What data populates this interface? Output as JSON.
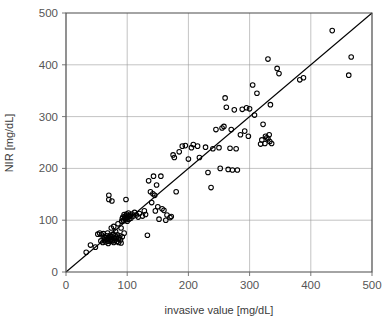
{
  "chart_data": {
    "type": "scatter",
    "title": "",
    "xlabel": "invasive value [mg/dL]",
    "ylabel": "NIR [mg/dL]",
    "xlim": [
      0,
      500
    ],
    "ylim": [
      0,
      500
    ],
    "xticks": [
      0,
      100,
      200,
      300,
      400,
      500
    ],
    "yticks": [
      0,
      100,
      200,
      300,
      400,
      500
    ],
    "xtick_labels": [
      "0",
      "100",
      "200",
      "300",
      "400",
      "500"
    ],
    "ytick_labels": [
      "0",
      "100",
      "200",
      "300",
      "400",
      "500"
    ],
    "grid": true,
    "legend": "none",
    "marker": "open-circle",
    "marker_color": "#000000",
    "annotations": [
      {
        "type": "line",
        "name": "identity-line",
        "description": "y = x reference line",
        "from": [
          0,
          0
        ],
        "to": [
          500,
          500
        ]
      }
    ],
    "series": [
      {
        "name": "NIR vs invasive",
        "points": [
          [
            33,
            38
          ],
          [
            40,
            52
          ],
          [
            48,
            48
          ],
          [
            52,
            73
          ],
          [
            55,
            75
          ],
          [
            57,
            60
          ],
          [
            58,
            72
          ],
          [
            60,
            57
          ],
          [
            61,
            74
          ],
          [
            62,
            68
          ],
          [
            63,
            62
          ],
          [
            64,
            66
          ],
          [
            65,
            58
          ],
          [
            66,
            70
          ],
          [
            67,
            64
          ],
          [
            68,
            75
          ],
          [
            68,
            60
          ],
          [
            69,
            55
          ],
          [
            70,
            148
          ],
          [
            70,
            140
          ],
          [
            71,
            66
          ],
          [
            72,
            71
          ],
          [
            72,
            59
          ],
          [
            73,
            64
          ],
          [
            74,
            85
          ],
          [
            74,
            62
          ],
          [
            75,
            137
          ],
          [
            75,
            68
          ],
          [
            76,
            60
          ],
          [
            77,
            73
          ],
          [
            78,
            88
          ],
          [
            78,
            57
          ],
          [
            79,
            65
          ],
          [
            80,
            70
          ],
          [
            80,
            61
          ],
          [
            81,
            78
          ],
          [
            82,
            67
          ],
          [
            83,
            59
          ],
          [
            84,
            72
          ],
          [
            85,
            93
          ],
          [
            85,
            64
          ],
          [
            86,
            57
          ],
          [
            87,
            66
          ],
          [
            88,
            70
          ],
          [
            89,
            62
          ],
          [
            90,
            85
          ],
          [
            90,
            56
          ],
          [
            91,
            98
          ],
          [
            92,
            103
          ],
          [
            92,
            68
          ],
          [
            93,
            106
          ],
          [
            94,
            99
          ],
          [
            95,
            111
          ],
          [
            95,
            75
          ],
          [
            96,
            104
          ],
          [
            97,
            108
          ],
          [
            98,
            101
          ],
          [
            98,
            140
          ],
          [
            99,
            112
          ],
          [
            100,
            105
          ],
          [
            100,
            98
          ],
          [
            101,
            109
          ],
          [
            102,
            114
          ],
          [
            103,
            102
          ],
          [
            104,
            107
          ],
          [
            105,
            110
          ],
          [
            106,
            104
          ],
          [
            108,
            112
          ],
          [
            110,
            108
          ],
          [
            112,
            115
          ],
          [
            115,
            110
          ],
          [
            118,
            106
          ],
          [
            120,
            113
          ],
          [
            125,
            108
          ],
          [
            128,
            118
          ],
          [
            130,
            111
          ],
          [
            133,
            71
          ],
          [
            135,
            176
          ],
          [
            138,
            155
          ],
          [
            140,
            134
          ],
          [
            142,
            151
          ],
          [
            143,
            185
          ],
          [
            145,
            148
          ],
          [
            146,
            118
          ],
          [
            148,
            168
          ],
          [
            150,
            126
          ],
          [
            152,
            102
          ],
          [
            155,
            185
          ],
          [
            157,
            122
          ],
          [
            160,
            119
          ],
          [
            163,
            100
          ],
          [
            165,
            110
          ],
          [
            170,
            105
          ],
          [
            172,
            107
          ],
          [
            175,
            226
          ],
          [
            177,
            221
          ],
          [
            180,
            155
          ],
          [
            185,
            232
          ],
          [
            190,
            243
          ],
          [
            195,
            244
          ],
          [
            200,
            218
          ],
          [
            205,
            240
          ],
          [
            208,
            246
          ],
          [
            215,
            243
          ],
          [
            218,
            221
          ],
          [
            228,
            241
          ],
          [
            232,
            192
          ],
          [
            237,
            163
          ],
          [
            240,
            238
          ],
          [
            245,
            275
          ],
          [
            250,
            240
          ],
          [
            252,
            200
          ],
          [
            255,
            278
          ],
          [
            258,
            281
          ],
          [
            260,
            336
          ],
          [
            262,
            318
          ],
          [
            265,
            198
          ],
          [
            268,
            239
          ],
          [
            270,
            275
          ],
          [
            272,
            197
          ],
          [
            275,
            313
          ],
          [
            278,
            238
          ],
          [
            280,
            197
          ],
          [
            285,
            265
          ],
          [
            288,
            314
          ],
          [
            292,
            272
          ],
          [
            295,
            317
          ],
          [
            298,
            262
          ],
          [
            300,
            315
          ],
          [
            305,
            361
          ],
          [
            308,
            303
          ],
          [
            312,
            345
          ],
          [
            318,
            247
          ],
          [
            320,
            255
          ],
          [
            322,
            285
          ],
          [
            325,
            248
          ],
          [
            326,
            262
          ],
          [
            328,
            259
          ],
          [
            330,
            411
          ],
          [
            330,
            257
          ],
          [
            332,
            265
          ],
          [
            333,
            252
          ],
          [
            334,
            323
          ],
          [
            336,
            248
          ],
          [
            345,
            393
          ],
          [
            348,
            383
          ],
          [
            382,
            371
          ],
          [
            388,
            375
          ],
          [
            435,
            466
          ],
          [
            462,
            380
          ],
          [
            466,
            415
          ]
        ]
      }
    ]
  },
  "axes": {
    "plot_left_px": 66,
    "plot_right_px": 372,
    "plot_top_px": 13,
    "plot_bottom_px": 272
  }
}
